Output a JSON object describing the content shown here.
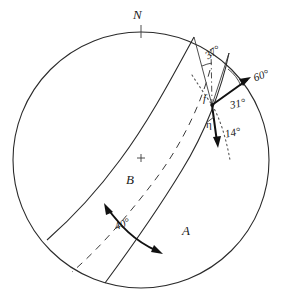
{
  "figure": {
    "kind": "stereographic-projection",
    "colors": {
      "line": "#3a3a3a",
      "bold_line": "#111111",
      "background": "#ffffff",
      "text": "#1a1a1a"
    },
    "primitive_circle": {
      "center_x": 141,
      "center_y": 160,
      "radius": 128
    },
    "center_mark": {
      "symbol": "+",
      "x": 141,
      "y": 158
    },
    "north_tick": {
      "label": "N",
      "x": 141,
      "y": 32
    },
    "node_point": {
      "x": 212,
      "y": 105
    }
  },
  "labels": {
    "north": "N",
    "great_circle_a": "A",
    "great_circle_b": "B",
    "slip_vector": "f",
    "eta": "η",
    "angle_37": "37°",
    "angle_60": "60°",
    "angle_31": "31°",
    "angle_14": "14°",
    "angle_40": "40°"
  },
  "annotations": [
    {
      "name": "north-label",
      "text": "N",
      "kind": "cardinal-direction"
    },
    {
      "name": "angle-37",
      "text": "37°",
      "kind": "angle-measure"
    },
    {
      "name": "angle-60",
      "text": "60°",
      "kind": "angle-measure"
    },
    {
      "name": "angle-31",
      "text": "31°",
      "kind": "angle-measure"
    },
    {
      "name": "angle-14",
      "text": "14°",
      "kind": "angle-measure"
    },
    {
      "name": "angle-40",
      "text": "40°",
      "kind": "angle-measure"
    },
    {
      "name": "label-f",
      "text": "f",
      "kind": "vector-label"
    },
    {
      "name": "label-eta",
      "text": "η",
      "kind": "greek-symbol"
    },
    {
      "name": "label-a",
      "text": "A",
      "kind": "plane-label"
    },
    {
      "name": "label-b",
      "text": "B",
      "kind": "plane-label"
    }
  ]
}
